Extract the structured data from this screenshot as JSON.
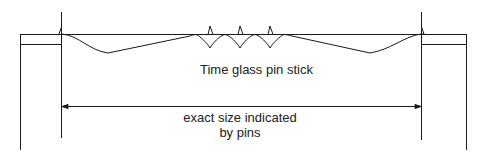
{
  "diagram": {
    "caption": "Time glass pin stick",
    "dimension_label_line1": "exact size indicated",
    "dimension_label_line2": "by pins",
    "stroke_color": "#1a1a1a",
    "elements": {
      "left_block": "rectangle",
      "right_block": "rectangle",
      "pin_stick": "horizontal stick with curved sag and three scalloped pins",
      "pins": 5,
      "dimension_arrow": "double-headed arrow between end pins"
    }
  }
}
